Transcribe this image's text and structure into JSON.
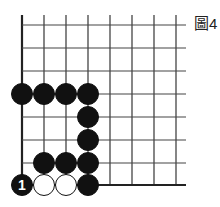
{
  "figure_label": "圖4",
  "board": {
    "columns": [
      22,
      44,
      66,
      88,
      110,
      132,
      154,
      176
    ],
    "rows": [
      25,
      48,
      71,
      94,
      117,
      140,
      163,
      185
    ],
    "line_top": 15,
    "line_right": 186,
    "stone_radius": 10.5,
    "black_color": "#111111",
    "white_color": "#ffffff"
  },
  "stones": [
    {
      "col": 0,
      "row": 3,
      "color": "black"
    },
    {
      "col": 1,
      "row": 3,
      "color": "black"
    },
    {
      "col": 2,
      "row": 3,
      "color": "black"
    },
    {
      "col": 3,
      "row": 3,
      "color": "black"
    },
    {
      "col": 3,
      "row": 4,
      "color": "black"
    },
    {
      "col": 3,
      "row": 5,
      "color": "black"
    },
    {
      "col": 1,
      "row": 6,
      "color": "black"
    },
    {
      "col": 2,
      "row": 6,
      "color": "black"
    },
    {
      "col": 3,
      "row": 6,
      "color": "black"
    },
    {
      "col": 0,
      "row": 7,
      "color": "black",
      "number": "1"
    },
    {
      "col": 1,
      "row": 7,
      "color": "white"
    },
    {
      "col": 2,
      "row": 7,
      "color": "white"
    },
    {
      "col": 3,
      "row": 7,
      "color": "black"
    }
  ]
}
